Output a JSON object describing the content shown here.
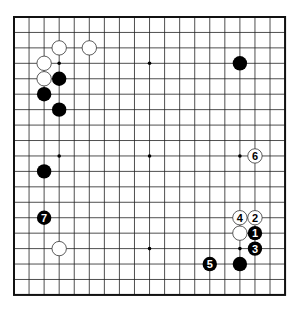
{
  "board": {
    "size": 19,
    "origin_x": 14,
    "origin_y": 17,
    "step_x": 15.06,
    "step_y": 15.44,
    "stone_radius": 7.2,
    "line_color": "#222222",
    "edge_color": "#111111",
    "black_color": "#000000",
    "white_fill": "#ffffff",
    "white_stroke": "#333333"
  },
  "star_points": [
    [
      3,
      3
    ],
    [
      9,
      3
    ],
    [
      15,
      3
    ],
    [
      3,
      9
    ],
    [
      9,
      9
    ],
    [
      15,
      9
    ],
    [
      3,
      15
    ],
    [
      9,
      15
    ],
    [
      15,
      15
    ]
  ],
  "stones": [
    {
      "color": "white",
      "col": 3,
      "row": 2,
      "label": ""
    },
    {
      "color": "white",
      "col": 5,
      "row": 2,
      "label": ""
    },
    {
      "color": "white",
      "col": 2,
      "row": 3,
      "label": ""
    },
    {
      "color": "white",
      "col": 2,
      "row": 4,
      "label": ""
    },
    {
      "color": "black",
      "col": 3,
      "row": 4,
      "label": ""
    },
    {
      "color": "black",
      "col": 2,
      "row": 5,
      "label": ""
    },
    {
      "color": "black",
      "col": 3,
      "row": 6,
      "label": ""
    },
    {
      "color": "black",
      "col": 15,
      "row": 3,
      "label": ""
    },
    {
      "color": "black",
      "col": 2,
      "row": 10,
      "label": ""
    },
    {
      "color": "black",
      "col": 2,
      "row": 13,
      "label": "7"
    },
    {
      "color": "white",
      "col": 3,
      "row": 15,
      "label": ""
    },
    {
      "color": "white",
      "col": 16,
      "row": 9,
      "label": "6"
    },
    {
      "color": "white",
      "col": 15,
      "row": 13,
      "label": "4"
    },
    {
      "color": "white",
      "col": 16,
      "row": 13,
      "label": "2"
    },
    {
      "color": "white",
      "col": 15,
      "row": 14,
      "label": ""
    },
    {
      "color": "black",
      "col": 16,
      "row": 14,
      "label": "1"
    },
    {
      "color": "black",
      "col": 16,
      "row": 15,
      "label": "3"
    },
    {
      "color": "black",
      "col": 13,
      "row": 16,
      "label": "5"
    },
    {
      "color": "black",
      "col": 15,
      "row": 16,
      "label": ""
    }
  ]
}
